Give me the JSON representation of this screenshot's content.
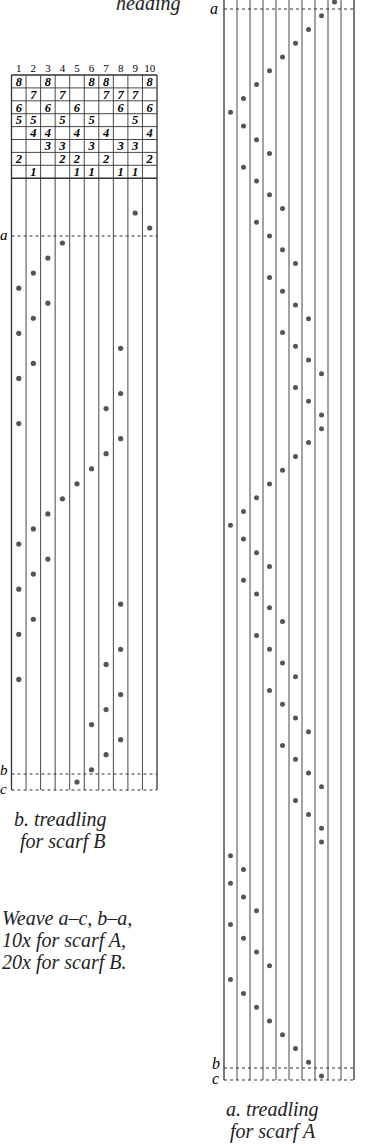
{
  "title_fragment": "heading",
  "left_chart": {
    "caption_line1": "b. treadling",
    "caption_line2": "for scarf B",
    "column_numbers": [
      "1",
      "2",
      "3",
      "4",
      "5",
      "6",
      "7",
      "8",
      "9",
      "10"
    ],
    "tieup_rows": [
      [
        "8",
        "",
        "8",
        "",
        "",
        "8",
        "8",
        "",
        "",
        "8"
      ],
      [
        "",
        "7",
        "",
        "7",
        "",
        "",
        "7",
        "7",
        "7",
        ""
      ],
      [
        "6",
        "",
        "6",
        "",
        "6",
        "",
        "",
        "6",
        "",
        "6"
      ],
      [
        "5",
        "5",
        "",
        "5",
        "",
        "5",
        "",
        "",
        "5",
        ""
      ],
      [
        "",
        "4",
        "4",
        "",
        "4",
        "",
        "4",
        "",
        "",
        "4"
      ],
      [
        "",
        "",
        "3",
        "3",
        "",
        "3",
        "",
        "3",
        "3",
        ""
      ],
      [
        "2",
        "",
        "",
        "2",
        "2",
        "",
        "2",
        "",
        "",
        "2"
      ],
      [
        "",
        "1",
        "",
        "",
        "1",
        "1",
        "",
        "1",
        "1",
        ""
      ]
    ],
    "markers": {
      "a": "a",
      "b": "b",
      "c": "c"
    },
    "treadling_sequence": [
      9,
      10,
      4,
      3,
      2,
      1,
      3,
      2,
      1,
      8,
      2,
      1,
      8,
      7,
      1,
      8,
      7,
      6,
      5,
      4,
      3,
      2,
      1,
      3,
      2,
      1,
      8,
      2,
      1,
      8,
      7,
      1,
      8,
      7,
      6,
      8,
      7,
      6,
      5
    ],
    "dot_color": "#555555",
    "line_color": "#333333"
  },
  "right_chart": {
    "caption_line1": "a. treadling",
    "caption_line2": "for scarf A",
    "markers": {
      "a": "a",
      "b": "b",
      "c": "c"
    },
    "treadling_sequence": [
      9,
      8,
      7,
      6,
      5,
      4,
      3,
      2,
      1,
      2,
      3,
      4,
      2,
      3,
      4,
      5,
      3,
      4,
      5,
      6,
      4,
      5,
      6,
      7,
      5,
      6,
      7,
      8,
      6,
      7,
      8,
      8,
      7,
      6,
      5,
      4,
      3,
      2,
      1,
      2,
      3,
      4,
      2,
      3,
      4,
      5,
      3,
      4,
      5,
      6,
      4,
      5,
      6,
      7,
      5,
      6,
      7,
      8,
      6,
      7,
      8,
      8,
      1,
      2,
      1,
      2,
      3,
      1,
      2,
      3,
      4,
      1,
      2,
      3,
      4,
      5,
      6,
      7,
      8
    ],
    "dot_color": "#555555",
    "line_color": "#333333"
  },
  "instructions": {
    "line1": "Weave a–c, b–a,",
    "line2": "10x for scarf A,",
    "line3": "20x for scarf B."
  }
}
